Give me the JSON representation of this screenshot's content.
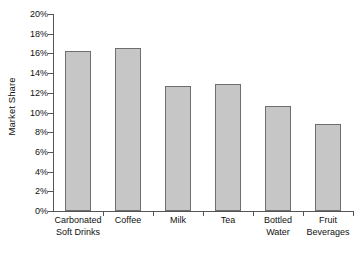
{
  "chart_data": {
    "type": "bar",
    "title": "",
    "xlabel": "",
    "ylabel": "Market Share",
    "categories": [
      "Carbonated Soft Drinks",
      "Coffee",
      "Milk",
      "Tea",
      "Bottled Water",
      "Fruit Beverages"
    ],
    "category_lines": [
      [
        "Carbonated",
        "Soft Drinks"
      ],
      [
        "Coffee",
        ""
      ],
      [
        "Milk",
        ""
      ],
      [
        "Tea",
        ""
      ],
      [
        "Bottled",
        "Water"
      ],
      [
        "Fruit",
        "Beverages"
      ]
    ],
    "values": [
      16.2,
      16.5,
      12.7,
      12.9,
      10.7,
      8.8
    ],
    "value_unit": "%",
    "ylim": [
      0,
      20
    ],
    "ytick_step": 2,
    "ytick_labels": [
      "20%",
      "18%",
      "16%",
      "14%",
      "12%",
      "10%",
      "8%",
      "6%",
      "4%",
      "2%",
      "0%"
    ],
    "ytick_values": [
      20,
      18,
      16,
      14,
      12,
      10,
      8,
      6,
      4,
      2,
      0
    ],
    "grid": false,
    "legend": false,
    "legend_position": "none",
    "bar_fill_color": "#c6c6c6",
    "bar_border_color": "#6e6e6e",
    "axis_color": "#555555",
    "text_color": "#111111",
    "background_color": "#ffffff"
  }
}
